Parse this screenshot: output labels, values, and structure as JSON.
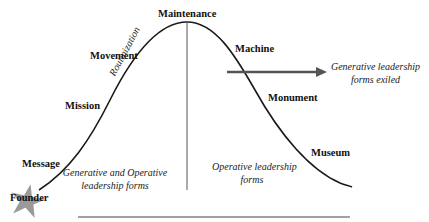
{
  "diagram": {
    "type": "organizational life cycle bell curve",
    "stages": [
      {
        "label": "Founder"
      },
      {
        "label": "Message"
      },
      {
        "label": "Mission"
      },
      {
        "label": "Movement"
      },
      {
        "label": "Maintenance"
      },
      {
        "label": "Machine"
      },
      {
        "label": "Monument"
      },
      {
        "label": "Museum"
      }
    ],
    "curve_label": "Routinization",
    "left_region": {
      "line1": "Generative and Operative",
      "line2": "leadership forms"
    },
    "right_region": {
      "line1": "Operative leadership",
      "line2": "forms"
    },
    "arrow_label": {
      "line1": "Generative leadership",
      "line2": "forms exiled"
    },
    "colors": {
      "line": "#1a1a1a",
      "arrow": "#555555",
      "star": "#9a9a9a"
    }
  }
}
